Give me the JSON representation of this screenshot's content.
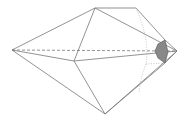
{
  "diagram": {
    "type": "polyhedron-wireframe",
    "stroke_color": "#777777",
    "hidden_color": "#aaaaaa",
    "fill_color": "#777777",
    "vertices": {
      "L": [
        12,
        50
      ],
      "R": [
        177,
        51
      ],
      "TL": [
        95,
        8
      ],
      "TR": [
        136,
        8
      ],
      "C": [
        74,
        61
      ],
      "B": [
        105,
        114
      ],
      "BR": [
        139,
        92
      ],
      "RU": [
        165,
        40
      ],
      "RL": [
        165,
        63
      ]
    }
  }
}
